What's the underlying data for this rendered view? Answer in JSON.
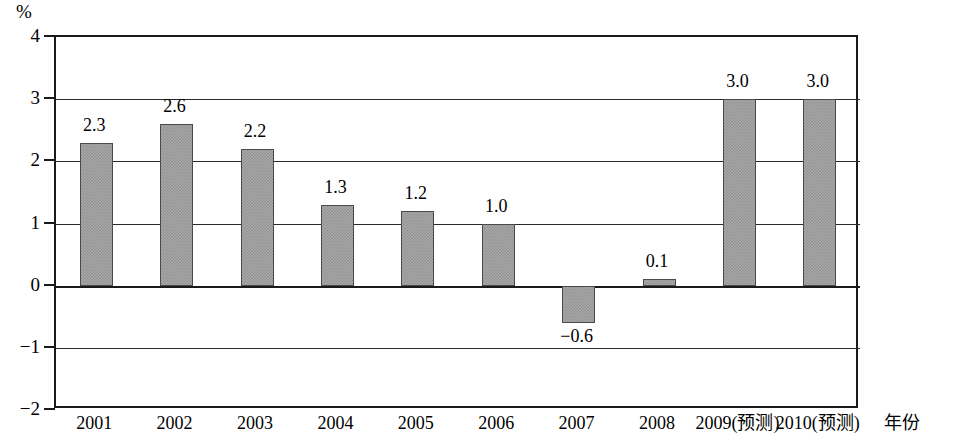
{
  "chart_data": {
    "type": "bar",
    "title": "",
    "subtitle": "",
    "xlabel": "年份",
    "ylabel": "%",
    "ylim": [
      -2,
      4
    ],
    "ytick_values": [
      4,
      3,
      2,
      1,
      0,
      -1,
      -2
    ],
    "ytick_labels": [
      "4",
      "3",
      "2",
      "1",
      "0",
      "−1",
      "−2"
    ],
    "grid": true,
    "legend": "none",
    "categories": [
      "2001",
      "2002",
      "2003",
      "2004",
      "2005",
      "2006",
      "2007",
      "2008",
      "2009(预测)",
      "2010(预测)"
    ],
    "values": [
      2.3,
      2.6,
      2.2,
      1.3,
      1.2,
      1.0,
      -0.6,
      0.1,
      3.0,
      3.0
    ],
    "value_labels": [
      "2.3",
      "2.6",
      "2.2",
      "1.3",
      "1.2",
      "1.0",
      "−0.6",
      "0.1",
      "3.0",
      "3.0"
    ],
    "series": [
      {
        "name": "",
        "values": [
          2.3,
          2.6,
          2.2,
          1.3,
          1.2,
          1.0,
          -0.6,
          0.1,
          3.0,
          3.0
        ]
      }
    ],
    "bar_fill_color": "#a9a9a9",
    "bar_border_color": "#4a4a4a",
    "axis_color": "#1a1a1a",
    "background_color": "#ffffff"
  }
}
